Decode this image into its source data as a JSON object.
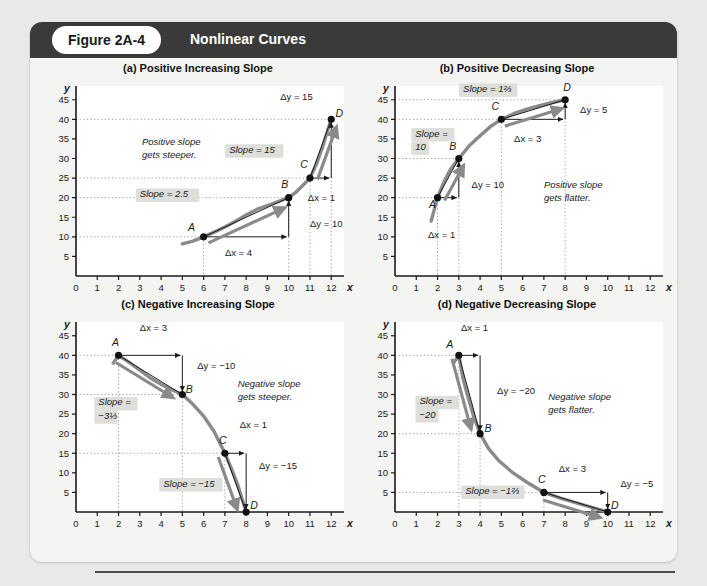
{
  "header": {
    "figure_pill": "Figure 2A-4",
    "title": "Nonlinear Curves"
  },
  "axis": {
    "x_label": "x",
    "y_label": "y",
    "x_ticks": [
      "0",
      "1",
      "2",
      "3",
      "4",
      "5",
      "6",
      "7",
      "8",
      "9",
      "10",
      "11",
      "12"
    ],
    "y_ticks": [
      "5",
      "10",
      "15",
      "20",
      "25",
      "30",
      "35",
      "40",
      "45"
    ],
    "x_min": 0,
    "x_max": 12.6,
    "y_min": 0,
    "y_max": 48
  },
  "colors": {
    "curve": "#8a8a8a",
    "arrow": "#8a8a8a",
    "axis": "#1a1a1a",
    "label_bg": "#dededa",
    "header_bg": "#3a3a3a",
    "panel_bg": "#ffffff",
    "figure_bg": "#f4f4f2",
    "page_bg": "#e9e9e7"
  },
  "chart_data": [
    {
      "id": "a",
      "type": "line",
      "title": "(a) Positive Increasing Slope",
      "xlabel": "x",
      "ylabel": "y",
      "xlim": [
        0,
        12.6
      ],
      "ylim": [
        0,
        48
      ],
      "grid": false,
      "points": [
        {
          "label": "A",
          "x": 6,
          "y": 10,
          "label_dx": -12,
          "label_dy": -6
        },
        {
          "label": "B",
          "x": 10,
          "y": 20,
          "label_dx": -4,
          "label_dy": -10
        },
        {
          "label": "C",
          "x": 11,
          "y": 25,
          "label_dx": -6,
          "label_dy": -10
        },
        {
          "label": "D",
          "x": 12,
          "y": 40,
          "label_dx": 8,
          "label_dy": -2
        }
      ],
      "curve": [
        [
          5.0,
          8.2
        ],
        [
          5.5,
          8.9
        ],
        [
          6,
          10
        ],
        [
          6.5,
          11.2
        ],
        [
          7,
          12.5
        ],
        [
          7.5,
          14.0
        ],
        [
          8,
          15.6
        ],
        [
          8.5,
          17.0
        ],
        [
          9,
          18.0
        ],
        [
          9.5,
          19.0
        ],
        [
          10,
          20
        ],
        [
          10.3,
          21.2
        ],
        [
          10.6,
          22.8
        ],
        [
          11,
          25
        ],
        [
          11.3,
          28.5
        ],
        [
          11.6,
          33.0
        ],
        [
          11.85,
          37.5
        ],
        [
          12,
          40
        ]
      ],
      "secants": [
        {
          "from": [
            6,
            10
          ],
          "to": [
            10,
            20
          ]
        },
        {
          "from": [
            11,
            25
          ],
          "to": [
            12,
            40
          ]
        }
      ],
      "annotations": [
        {
          "text": "Positive slope",
          "x": 3.1,
          "y": 33.5,
          "style": "plain-italic"
        },
        {
          "text": "gets steeper.",
          "x": 3.1,
          "y": 30.2,
          "style": "plain-italic"
        },
        {
          "text": "Slope = 2.5",
          "x": 3.0,
          "y": 20.2,
          "style": "boxed-italic"
        },
        {
          "text": "Slope = 15",
          "x": 7.2,
          "y": 31.5,
          "style": "boxed-italic"
        },
        {
          "text": "Δy = 15",
          "x": 9.6,
          "y": 45.0,
          "style": "plain"
        },
        {
          "text": "Δx = 1",
          "x": 10.9,
          "y": 19.2,
          "style": "plain"
        },
        {
          "text": "Δy = 10",
          "x": 11.0,
          "y": 12.6,
          "style": "plain"
        },
        {
          "text": "Δx = 4",
          "x": 7.0,
          "y": 5.0,
          "style": "plain"
        }
      ]
    },
    {
      "id": "b",
      "type": "line",
      "title": "(b) Positive Decreasing Slope",
      "xlabel": "x",
      "ylabel": "y",
      "xlim": [
        0,
        12.6
      ],
      "ylim": [
        0,
        48
      ],
      "grid": false,
      "points": [
        {
          "label": "A",
          "x": 2,
          "y": 20,
          "label_dx": -5,
          "label_dy": 10
        },
        {
          "label": "B",
          "x": 3,
          "y": 30,
          "label_dx": -6,
          "label_dy": -9
        },
        {
          "label": "C",
          "x": 5,
          "y": 40,
          "label_dx": -6,
          "label_dy": -9
        },
        {
          "label": "D",
          "x": 8,
          "y": 45,
          "label_dx": 2,
          "label_dy": -9
        }
      ],
      "curve": [
        [
          1.7,
          14.0
        ],
        [
          1.85,
          17.0
        ],
        [
          2,
          20
        ],
        [
          2.3,
          24.0
        ],
        [
          2.6,
          27.2
        ],
        [
          3,
          30
        ],
        [
          3.5,
          33.3
        ],
        [
          4,
          35.8
        ],
        [
          4.5,
          38.2
        ],
        [
          5,
          40
        ],
        [
          5.6,
          41.5
        ],
        [
          6.2,
          42.6
        ],
        [
          6.8,
          43.5
        ],
        [
          7.4,
          44.3
        ],
        [
          8,
          45
        ]
      ],
      "secants": [
        {
          "from": [
            2,
            20
          ],
          "to": [
            3,
            30
          ]
        },
        {
          "from": [
            5,
            40
          ],
          "to": [
            8,
            45
          ]
        }
      ],
      "annotations": [
        {
          "text": "Slope = 1⅔",
          "x": 3.2,
          "y": 47.0,
          "style": "boxed-italic"
        },
        {
          "text": "Slope =",
          "x": 0.95,
          "y": 35.6,
          "style": "boxed-italic"
        },
        {
          "text": "10",
          "x": 0.95,
          "y": 32.2,
          "style": "boxed-italic-cont"
        },
        {
          "text": "Δy = 5",
          "x": 8.7,
          "y": 41.5,
          "style": "plain"
        },
        {
          "text": "Δx = 3",
          "x": 5.6,
          "y": 34.2,
          "style": "plain"
        },
        {
          "text": "Δy = 10",
          "x": 3.6,
          "y": 22.5,
          "style": "plain"
        },
        {
          "text": "Δx = 1",
          "x": 1.55,
          "y": 9.8,
          "style": "plain"
        },
        {
          "text": "Positive slope",
          "x": 7.0,
          "y": 22.5,
          "style": "plain-italic"
        },
        {
          "text": "gets flatter.",
          "x": 7.0,
          "y": 19.2,
          "style": "plain-italic"
        }
      ]
    },
    {
      "id": "c",
      "type": "line",
      "title": "(c) Negative Increasing Slope",
      "xlabel": "x",
      "ylabel": "y",
      "xlim": [
        0,
        12.6
      ],
      "ylim": [
        0,
        48
      ],
      "grid": false,
      "points": [
        {
          "label": "A",
          "x": 2,
          "y": 40,
          "label_dx": -3,
          "label_dy": -9
        },
        {
          "label": "B",
          "x": 5,
          "y": 30,
          "label_dx": 7,
          "label_dy": -2
        },
        {
          "label": "C",
          "x": 7,
          "y": 15,
          "label_dx": -2,
          "label_dy": -9
        },
        {
          "label": "D",
          "x": 8,
          "y": 0,
          "label_dx": 8,
          "label_dy": -3
        }
      ],
      "curve": [
        [
          1.75,
          38.0
        ],
        [
          2,
          40
        ],
        [
          2.5,
          38.2
        ],
        [
          3,
          36.2
        ],
        [
          3.5,
          34.2
        ],
        [
          4,
          32.6
        ],
        [
          4.5,
          31.2
        ],
        [
          5,
          30
        ],
        [
          5.5,
          27.5
        ],
        [
          6,
          24.5
        ],
        [
          6.5,
          20.5
        ],
        [
          7,
          15
        ],
        [
          7.3,
          11.2
        ],
        [
          7.6,
          7.0
        ],
        [
          7.85,
          2.6
        ],
        [
          8,
          0
        ]
      ],
      "secants": [
        {
          "from": [
            2,
            40
          ],
          "to": [
            5,
            30
          ]
        },
        {
          "from": [
            7,
            15
          ],
          "to": [
            8,
            0
          ]
        }
      ],
      "annotations": [
        {
          "text": "Δx = 3",
          "x": 3.0,
          "y": 46.2,
          "style": "plain"
        },
        {
          "text": "Δy = −10",
          "x": 5.7,
          "y": 36.5,
          "style": "plain"
        },
        {
          "text": "Slope =",
          "x": 1.05,
          "y": 27.2,
          "style": "boxed-italic"
        },
        {
          "text": "−3⅓",
          "x": 1.05,
          "y": 23.8,
          "style": "boxed-italic-cont"
        },
        {
          "text": "Negative slope",
          "x": 7.6,
          "y": 32.0,
          "style": "plain-italic"
        },
        {
          "text": "gets steeper.",
          "x": 7.6,
          "y": 28.7,
          "style": "plain-italic"
        },
        {
          "text": "Δx = 1",
          "x": 7.7,
          "y": 21.5,
          "style": "plain"
        },
        {
          "text": "Δy = −15",
          "x": 8.6,
          "y": 11.0,
          "style": "plain"
        },
        {
          "text": "Slope = −15",
          "x": 4.1,
          "y": 6.5,
          "style": "boxed-italic"
        }
      ]
    },
    {
      "id": "d",
      "type": "line",
      "title": "(d) Negative Decreasing Slope",
      "xlabel": "x",
      "ylabel": "y",
      "xlim": [
        0,
        12.6
      ],
      "ylim": [
        0,
        48
      ],
      "grid": false,
      "points": [
        {
          "label": "A",
          "x": 3,
          "y": 40,
          "label_dx": -9,
          "label_dy": -7
        },
        {
          "label": "B",
          "x": 4,
          "y": 20,
          "label_dx": 8,
          "label_dy": -2
        },
        {
          "label": "C",
          "x": 7,
          "y": 5,
          "label_dx": -2,
          "label_dy": -9
        },
        {
          "label": "D",
          "x": 10,
          "y": 0,
          "label_dx": 7,
          "label_dy": -3
        }
      ],
      "curve": [
        [
          2.75,
          38.0
        ],
        [
          3,
          40
        ],
        [
          3.2,
          34.0
        ],
        [
          3.45,
          29.0
        ],
        [
          3.7,
          24.4
        ],
        [
          4,
          20
        ],
        [
          4.4,
          16.2
        ],
        [
          4.9,
          13.0
        ],
        [
          5.5,
          10.2
        ],
        [
          6.2,
          7.6
        ],
        [
          7,
          5
        ],
        [
          7.8,
          3.5
        ],
        [
          8.6,
          2.2
        ],
        [
          9.3,
          1.1
        ],
        [
          10,
          0
        ]
      ],
      "secants": [
        {
          "from": [
            3,
            40
          ],
          "to": [
            4,
            20
          ]
        },
        {
          "from": [
            7,
            5
          ],
          "to": [
            10,
            0
          ]
        }
      ],
      "annotations": [
        {
          "text": "Δx = 1",
          "x": 3.1,
          "y": 46.2,
          "style": "plain"
        },
        {
          "text": "Δy = −20",
          "x": 4.8,
          "y": 30.2,
          "style": "plain"
        },
        {
          "text": "Slope =",
          "x": 1.15,
          "y": 27.5,
          "style": "boxed-italic"
        },
        {
          "text": "−20",
          "x": 1.15,
          "y": 24.1,
          "style": "boxed-italic-cont"
        },
        {
          "text": "Negative slope",
          "x": 7.2,
          "y": 28.5,
          "style": "plain-italic"
        },
        {
          "text": "gets flatter.",
          "x": 7.2,
          "y": 25.2,
          "style": "plain-italic"
        },
        {
          "text": "Δx = 3",
          "x": 7.7,
          "y": 10.3,
          "style": "plain"
        },
        {
          "text": "Δy = −5",
          "x": 10.6,
          "y": 6.5,
          "style": "plain"
        },
        {
          "text": "Slope = −1⅔",
          "x": 3.3,
          "y": 4.6,
          "style": "boxed-italic"
        }
      ]
    }
  ]
}
